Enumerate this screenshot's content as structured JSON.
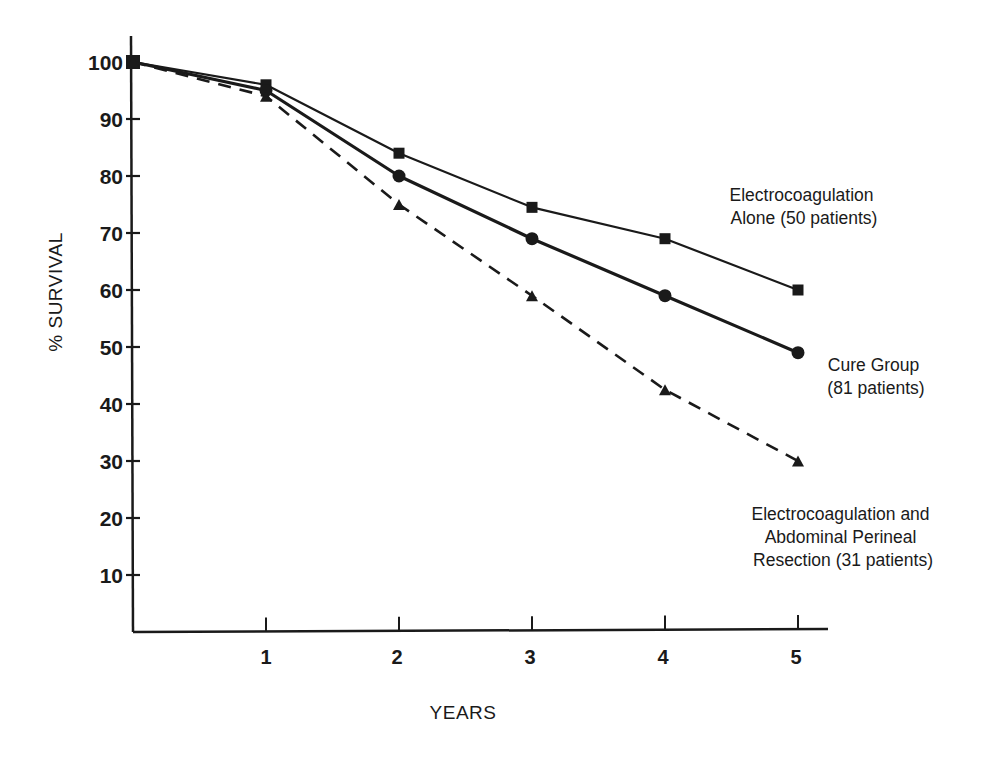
{
  "chart_data": {
    "type": "line",
    "title": "",
    "xlabel": "YEARS",
    "ylabel": "% SURVIVAL",
    "x": [
      0,
      1,
      2,
      3,
      4,
      5
    ],
    "xticks": [
      "1",
      "2",
      "3",
      "4",
      "5"
    ],
    "yticks": [
      "10",
      "20",
      "30",
      "40",
      "50",
      "60",
      "70",
      "80",
      "90",
      "100"
    ],
    "xlim": [
      0,
      5
    ],
    "ylim": [
      0,
      100
    ],
    "grid": false,
    "legend_position": "inline annotations at right end of lines",
    "series": [
      {
        "name": "Electrocoagulation Alone (50 patients)",
        "marker": "square",
        "line_style": "solid",
        "values": [
          100,
          96,
          84,
          74.5,
          69,
          60
        ]
      },
      {
        "name": "Cure Group (81 patients)",
        "marker": "circle",
        "line_style": "solid-thick",
        "values": [
          100,
          95,
          80,
          69,
          59,
          49
        ]
      },
      {
        "name": "Electrocoagulation and Abdominal Perineal Resection (31 patients)",
        "marker": "triangle",
        "line_style": "dashed",
        "values": [
          100,
          94,
          75,
          59,
          42.5,
          30
        ]
      }
    ],
    "annotations": [
      {
        "lines": [
          "Electrocoagulation",
          "Alone (50 patients)"
        ]
      },
      {
        "lines": [
          "Cure Group",
          "(81 patients)"
        ]
      },
      {
        "lines": [
          "Electrocoagulation and",
          "Abdominal Perineal",
          "Resection (31 patients)"
        ]
      }
    ]
  },
  "colors": {
    "ink": "#1a1a1a",
    "background": "#ffffff"
  }
}
